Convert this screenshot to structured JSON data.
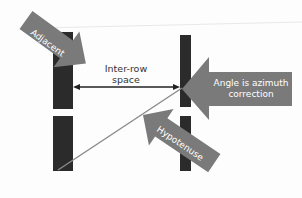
{
  "diagram": {
    "colors": {
      "background": "#fdfdfd",
      "row_bar": "#2b2b2b",
      "callout": "#7a7a7a",
      "callout_text": "#ffffff",
      "label_text": "#333333",
      "hypotenuse_line": "#8a8a8a",
      "spacing_arrow": "#222222"
    },
    "labels": {
      "adjacent": "Adjacent",
      "inter_row_line1": "Inter-row",
      "inter_row_line2": "space",
      "angle_line1": "Angle is azimuth",
      "angle_line2": "correction",
      "hypotenuse": "Hypotenuse"
    }
  }
}
